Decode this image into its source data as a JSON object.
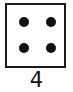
{
  "figure": {
    "name": "die-face",
    "caption": "4",
    "shape": "square",
    "border_color": "#1a1a1a",
    "face_color": "#ffffff",
    "pip_color": "#111111",
    "background_color": "#ffffff",
    "pip_count": 4,
    "pips": [
      {
        "id": "top-left",
        "row": "top",
        "column": "left"
      },
      {
        "id": "top-right",
        "row": "top",
        "column": "right"
      },
      {
        "id": "bottom-left",
        "row": "bottom",
        "column": "left"
      },
      {
        "id": "bottom-right",
        "row": "bottom",
        "column": "right"
      }
    ]
  }
}
